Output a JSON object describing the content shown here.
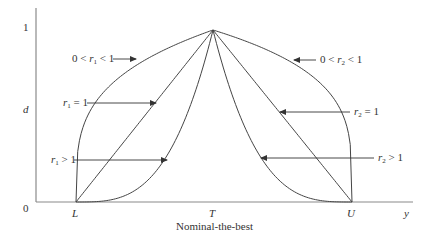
{
  "diagram": {
    "title": "Nominal-the-best",
    "y_axis_label": "d",
    "x_axis_label": "y",
    "y_ticks": [
      "0",
      "1"
    ],
    "x_ticks": [
      "L",
      "T",
      "U"
    ],
    "colors": {
      "line": "#444444",
      "axis": "#888888",
      "text": "#333333"
    },
    "annotations": {
      "left_concave": {
        "prefix": "0 < ",
        "var": "r",
        "sub": "1",
        "suffix": " < 1"
      },
      "left_linear": {
        "prefix": "",
        "var": "r",
        "sub": "1",
        "suffix": " = 1"
      },
      "left_convex": {
        "prefix": "",
        "var": "r",
        "sub": "1",
        "suffix": " > 1"
      },
      "right_concave": {
        "prefix": "0 < ",
        "var": "r",
        "sub": "2",
        "suffix": " < 1"
      },
      "right_linear": {
        "prefix": "",
        "var": "r",
        "sub": "2",
        "suffix": " = 1"
      },
      "right_convex": {
        "prefix": "",
        "var": "r",
        "sub": "2",
        "suffix": " > 1"
      }
    }
  },
  "chart_data": {
    "type": "line",
    "title": "Nominal-the-best",
    "xlabel": "y",
    "ylabel": "d",
    "x_ticks": [
      "L",
      "T",
      "U"
    ],
    "y_ticks": [
      0,
      1
    ],
    "ylim": [
      0,
      1
    ],
    "series": [
      {
        "name": "0 < r1 < 1",
        "side": "left",
        "shape": "concave",
        "points": [
          [
            "L",
            0
          ],
          [
            "T",
            1
          ]
        ]
      },
      {
        "name": "r1 = 1",
        "side": "left",
        "shape": "linear",
        "points": [
          [
            "L",
            0
          ],
          [
            "T",
            1
          ]
        ]
      },
      {
        "name": "r1 > 1",
        "side": "left",
        "shape": "convex",
        "points": [
          [
            "L",
            0
          ],
          [
            "T",
            1
          ]
        ]
      },
      {
        "name": "0 < r2 < 1",
        "side": "right",
        "shape": "concave",
        "points": [
          [
            "T",
            1
          ],
          [
            "U",
            0
          ]
        ]
      },
      {
        "name": "r2 = 1",
        "side": "right",
        "shape": "linear",
        "points": [
          [
            "T",
            1
          ],
          [
            "U",
            0
          ]
        ]
      },
      {
        "name": "r2 > 1",
        "side": "right",
        "shape": "convex",
        "points": [
          [
            "T",
            1
          ],
          [
            "U",
            0
          ]
        ]
      }
    ]
  }
}
